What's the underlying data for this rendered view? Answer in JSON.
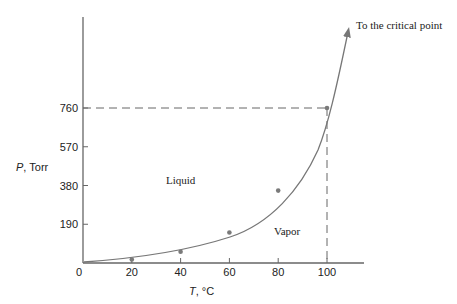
{
  "chart_data": {
    "type": "line",
    "title": "",
    "xlabel": "T, °C",
    "ylabel": "P, Torr",
    "x_ticks": [
      "0",
      "20",
      "40",
      "60",
      "80",
      "100"
    ],
    "y_ticks": [
      "0",
      "190",
      "380",
      "570",
      "760"
    ],
    "xlim": [
      0,
      115
    ],
    "ylim": [
      0,
      1000
    ],
    "series": [
      {
        "name": "Vapor pressure of water",
        "x": [
          20,
          40,
          60,
          80,
          100
        ],
        "values": [
          17.5,
          55.3,
          149.4,
          355.1,
          760
        ]
      }
    ],
    "reference_lines": {
      "x": 100,
      "y": 760,
      "style": "dashed"
    },
    "annotations": [
      "To the critical point",
      "Liquid",
      "Vapor"
    ],
    "grid": false,
    "legend": "none"
  },
  "labels": {
    "xlabel_italic": "T",
    "xlabel_rest": ", °C",
    "ylabel_italic": "P",
    "ylabel_rest": ", Torr",
    "critical": "To the critical point",
    "liquid": "Liquid",
    "vapor": "Vapor"
  },
  "colors": {
    "axis": "#666666",
    "curve": "#777777",
    "point": "#7a7a7a",
    "text": "#222222"
  }
}
